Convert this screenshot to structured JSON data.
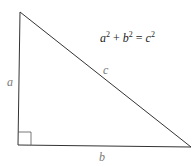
{
  "diagram": {
    "type": "right-triangle",
    "vertices": {
      "top": [
        20,
        12
      ],
      "right_angle": [
        18,
        145
      ],
      "bottom_right": [
        191,
        147
      ]
    },
    "right_angle_marker_size": 13,
    "labels": {
      "a": "a",
      "b": "b",
      "c": "c"
    },
    "formula": {
      "a": "a",
      "b": "b",
      "c": "c",
      "exp": "2",
      "plus": " + ",
      "equals": " = "
    },
    "colors": {
      "line": "#333333",
      "label": "#7a7a7a",
      "formula": "#222222"
    }
  }
}
